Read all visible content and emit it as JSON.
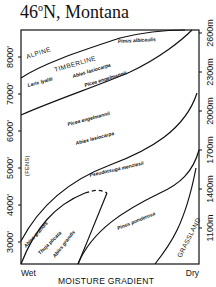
{
  "title": {
    "main": "46",
    "degree": "o",
    "rest": "N, Montana"
  },
  "axes": {
    "x_title": "MOISTURE GRADIENT",
    "x_left": "Wet",
    "x_right": "Dry",
    "left_ticks": [
      "8000'",
      "7000'",
      "6000'",
      "5000'",
      "4000'",
      "3000'"
    ],
    "right_ticks": [
      "2600m",
      "2300m",
      "2000m",
      "1700m",
      "1400m",
      "1100m"
    ]
  },
  "zones": {
    "alpine": "ALPINE",
    "timberline": "TIMBERLINE",
    "grassland": "GRASSLAND",
    "fens": "(FENS)"
  },
  "species": {
    "pinus_albicaulis": "Pinus albicaulis",
    "larix_lyallii": "Larix lyallii",
    "abies_lasiocarpa_upper": "Abies lasiocarpa",
    "picea_engelmannii_upper": "Picea engelmannii",
    "picea_engelmannii_mid": "Picea engelmannii",
    "abies_lasiocarpa_mid": "Abies lasiocarpa",
    "pseudotsuga_menziesii": "Pseudotsuga menziesii",
    "abies_grandis_left": "Abies grandis",
    "thuja_plicata": "Thuja plicata",
    "abies_grandis_right": "Abies grandis",
    "pinus_ponderosa": "Pinus ponderosa"
  }
}
